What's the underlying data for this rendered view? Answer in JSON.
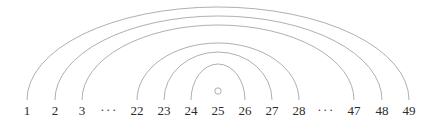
{
  "figure": {
    "kind": "arc-diagram",
    "background_color": "#ffffff",
    "width": 436,
    "height": 126
  },
  "style": {
    "arc_stroke_color": "#9a9a9a",
    "arc_stroke_width": 0.8,
    "label_color": "#2b2b2b",
    "label_font_size": 13,
    "marker_stroke_color": "#9a9a9a",
    "marker_fill_color": "#ffffff"
  },
  "baseline": {
    "y": 100,
    "nodes": [
      {
        "id": "n1",
        "label": "1",
        "x": 27,
        "is_ellipsis": false
      },
      {
        "id": "n2",
        "label": "2",
        "x": 55,
        "is_ellipsis": false
      },
      {
        "id": "n3",
        "label": "3",
        "x": 82,
        "is_ellipsis": false
      },
      {
        "id": "gapL",
        "label": "···",
        "x": 109,
        "is_ellipsis": true
      },
      {
        "id": "n22",
        "label": "22",
        "x": 137,
        "is_ellipsis": false
      },
      {
        "id": "n23",
        "label": "23",
        "x": 164,
        "is_ellipsis": false
      },
      {
        "id": "n24",
        "label": "24",
        "x": 191,
        "is_ellipsis": false
      },
      {
        "id": "n25",
        "label": "25",
        "x": 218,
        "is_ellipsis": false
      },
      {
        "id": "n26",
        "label": "26",
        "x": 245,
        "is_ellipsis": false
      },
      {
        "id": "n27",
        "label": "27",
        "x": 272,
        "is_ellipsis": false
      },
      {
        "id": "n28",
        "label": "28",
        "x": 299,
        "is_ellipsis": false
      },
      {
        "id": "gapR",
        "label": "···",
        "x": 326,
        "is_ellipsis": true
      },
      {
        "id": "n47",
        "label": "47",
        "x": 354,
        "is_ellipsis": false
      },
      {
        "id": "n48",
        "label": "48",
        "x": 382,
        "is_ellipsis": false
      },
      {
        "id": "n49",
        "label": "49",
        "x": 409,
        "is_ellipsis": false
      }
    ]
  },
  "arcs": [
    {
      "id": "arc-1-49",
      "from_label": "1",
      "to_label": "49",
      "x1": 27,
      "x2": 409,
      "apex_y": 7
    },
    {
      "id": "arc-2-48",
      "from_label": "2",
      "to_label": "48",
      "x1": 55,
      "x2": 382,
      "apex_y": 16
    },
    {
      "id": "arc-3-47",
      "from_label": "3",
      "to_label": "47",
      "x1": 82,
      "x2": 354,
      "apex_y": 25
    },
    {
      "id": "arc-22-28",
      "from_label": "22",
      "to_label": "28",
      "x1": 137,
      "x2": 299,
      "apex_y": 43
    },
    {
      "id": "arc-23-27",
      "from_label": "23",
      "to_label": "27",
      "x1": 164,
      "x2": 272,
      "apex_y": 52
    },
    {
      "id": "arc-24-26",
      "from_label": "24",
      "to_label": "26",
      "x1": 191,
      "x2": 245,
      "apex_y": 64
    }
  ],
  "marker": {
    "id": "center-node-marker",
    "above_label": "25",
    "cx": 218,
    "cy": 91,
    "r": 3.2
  }
}
